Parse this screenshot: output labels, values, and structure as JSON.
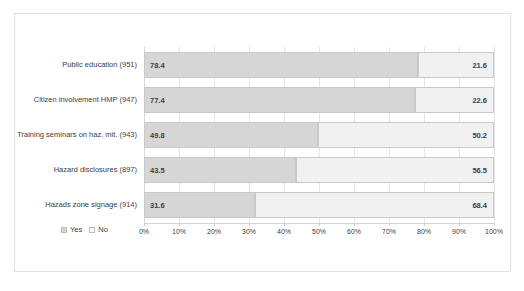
{
  "chart_data": {
    "type": "bar",
    "subtype": "stacked-horizontal-100",
    "title": "",
    "subtitle": "",
    "xlabel": "",
    "ylabel": "",
    "xlim": [
      0,
      100
    ],
    "grid": true,
    "legend_position": "bottom-left",
    "categories": [
      "Public education (951)",
      "Citizen involvement HMP (947)",
      "Training seminars on haz. mit. (943)",
      "Hazard disclosures (897)",
      "Hazads zone signage (914)"
    ],
    "series": [
      {
        "name": "Yes",
        "color": "#d6d6d6",
        "values": [
          78.4,
          77.4,
          49.8,
          43.5,
          31.6
        ]
      },
      {
        "name": "No",
        "color": "#f1f1f1",
        "values": [
          21.6,
          22.6,
          50.2,
          56.5,
          68.4
        ]
      }
    ],
    "value_labels": {
      "yes": [
        "78.4",
        "77.4",
        "49.8",
        "43.5",
        "31.6"
      ],
      "no": [
        "21.6",
        "22.6",
        "50.2",
        "56.5",
        "68.4"
      ]
    },
    "xticks": [
      0,
      10,
      20,
      30,
      40,
      50,
      60,
      70,
      80,
      90,
      100
    ],
    "xtick_labels": [
      "0%",
      "10%",
      "20%",
      "30%",
      "40%",
      "50%",
      "60%",
      "70%",
      "80%",
      "90%",
      "100%"
    ]
  },
  "legend": {
    "items": [
      {
        "label": "Yes",
        "swatch": "yes-swatch"
      },
      {
        "label": "No",
        "swatch": "no-swatch"
      }
    ]
  },
  "colors": {
    "yes": "#d6d6d6",
    "no": "#f1f1f1",
    "grid": "#e6e6e6",
    "frame": "#e2e2e2",
    "text": "#3d3d3d"
  }
}
